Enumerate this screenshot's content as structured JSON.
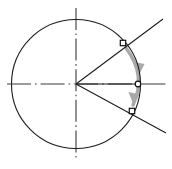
{
  "canvas": {
    "width": 172,
    "height": 169,
    "background": "#ffffff",
    "title": "Circle with centerlines, angular rotation arrow and point markers"
  },
  "colors": {
    "outline": "#1a1a1a",
    "centerline": "#3a3a3a",
    "arrow": "#a8a8a8",
    "marker_stroke": "#111111",
    "marker_fill": "#ffffff",
    "background": "#ffffff"
  },
  "chart_data": {
    "type": "scatter",
    "subtitle": "",
    "xlabel": "",
    "ylabel": "",
    "xlim": [
      0,
      172
    ],
    "ylim": [
      0,
      169
    ],
    "grid": false,
    "legend": false,
    "geometry": {
      "circle": {
        "label": "primary-circle",
        "cx": 76,
        "cy": 84,
        "r": 65,
        "stroke_width": 1.1
      },
      "center_point": {
        "label": "circle-center",
        "x": 76,
        "y": 84
      },
      "centerlines": [
        {
          "label": "vertical-centerline",
          "orientation": "vertical",
          "x1": 76,
          "y1": 8,
          "x2": 76,
          "y2": 161,
          "style": "dash-dot"
        },
        {
          "label": "horizontal-centerline",
          "orientation": "horizontal",
          "x1": 7,
          "y1": 84,
          "x2": 168,
          "y2": 84,
          "style": "dash-dot"
        }
      ],
      "radial_lines": [
        {
          "label": "upper-radial-line",
          "x1": 76,
          "y1": 84,
          "x2": 163,
          "y2": 19,
          "angle_deg": 36.8,
          "style": "solid"
        },
        {
          "label": "middle-radial-line",
          "x1": 76,
          "y1": 84,
          "x2": 139,
          "y2": 84,
          "angle_deg": 0,
          "style": "solid"
        },
        {
          "label": "lower-radial-line",
          "x1": 76,
          "y1": 84,
          "x2": 166,
          "y2": 133,
          "angle_deg": -28.6,
          "style": "solid"
        }
      ],
      "markers": [
        {
          "label": "upper-square-marker",
          "shape": "square",
          "x": 123,
          "y": 43,
          "size": 5.4
        },
        {
          "label": "axis-circle-marker",
          "shape": "circle",
          "x": 138,
          "y": 84,
          "size": 5.6
        },
        {
          "label": "lower-square-marker",
          "shape": "square",
          "x": 132,
          "y": 111,
          "size": 5.4
        }
      ],
      "rotation_arrow": {
        "label": "rotation-arc-arrow",
        "path": "M 126 48 Q 146 76 133 106",
        "arrowheads": [
          {
            "label": "mid-arrowhead",
            "x": 140,
            "y": 73,
            "angle_deg": 80
          },
          {
            "label": "end-arrowhead",
            "x": 135,
            "y": 102,
            "angle_deg": 110
          }
        ],
        "stroke_width": 3.4,
        "direction": "clockwise-downward"
      }
    },
    "series": [
      {
        "name": "markers",
        "x": [
          123,
          138,
          132
        ],
        "y": [
          43,
          84,
          111
        ],
        "shapes": [
          "square",
          "circle",
          "square"
        ]
      }
    ],
    "annotations": []
  }
}
